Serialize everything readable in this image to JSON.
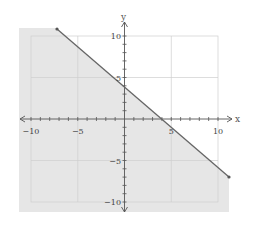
{
  "chart_data": {
    "type": "line",
    "title": "",
    "xlabel": "x",
    "ylabel": "y",
    "xlim": [
      -10,
      10
    ],
    "ylim": [
      -10,
      10
    ],
    "grid": true,
    "grid_step": 5,
    "minor_tick_step": 1,
    "x_ticks": [
      -10,
      -5,
      5,
      10
    ],
    "y_ticks": [
      10,
      5,
      -5,
      -10
    ],
    "x_tick_labels": [
      "−10",
      "−5",
      "5",
      "10"
    ],
    "y_tick_labels": [
      "10",
      "5",
      "−5",
      "−10"
    ],
    "boundary_line": {
      "equation": "y = -x + 4",
      "slope": -1,
      "intercept": 4,
      "style": "solid",
      "endpoints": [
        [
          -7.2,
          11.2
        ],
        [
          11.2,
          -7.2
        ]
      ]
    },
    "inequality": "x + y <= 4",
    "shaded_region": "below-left of the line",
    "colors": {
      "shade": "#e6e6e6",
      "line": "#666666",
      "grid": "#cfcfcf",
      "axis": "#555555"
    }
  }
}
